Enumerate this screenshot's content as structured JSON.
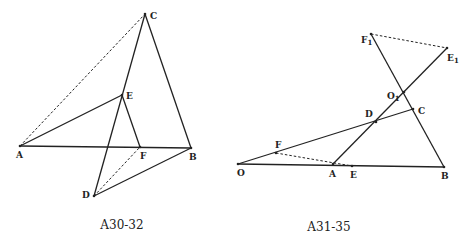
{
  "figures": [
    {
      "caption": "A30-32",
      "points": {
        "A": {
          "label": "A"
        },
        "B": {
          "label": "B"
        },
        "C": {
          "label": "C"
        },
        "D": {
          "label": "D"
        },
        "E": {
          "label": "E"
        },
        "F": {
          "label": "F"
        }
      },
      "solid_segments": [
        [
          "A",
          "B"
        ],
        [
          "C",
          "B"
        ],
        [
          "C",
          "D"
        ],
        [
          "A",
          "E"
        ],
        [
          "E",
          "F"
        ],
        [
          "D",
          "B"
        ]
      ],
      "dashed_segments": [
        [
          "A",
          "C"
        ],
        [
          "D",
          "F"
        ]
      ]
    },
    {
      "caption": "A31-35",
      "points": {
        "O": {
          "label": "O"
        },
        "A": {
          "label": "A"
        },
        "B": {
          "label": "B"
        },
        "C": {
          "label": "C"
        },
        "D": {
          "label": "D"
        },
        "E": {
          "label": "E"
        },
        "F": {
          "label": "F"
        },
        "F1": {
          "label": "F",
          "sub": "1"
        },
        "E1": {
          "label": "E",
          "sub": "1"
        },
        "O1": {
          "label": "O",
          "sub": "1"
        }
      },
      "solid_segments": [
        [
          "O",
          "B"
        ],
        [
          "O",
          "C"
        ],
        [
          "A",
          "E1"
        ],
        [
          "F1",
          "B"
        ]
      ],
      "dashed_segments": [
        [
          "F",
          "E"
        ],
        [
          "F1",
          "E1"
        ]
      ]
    }
  ]
}
